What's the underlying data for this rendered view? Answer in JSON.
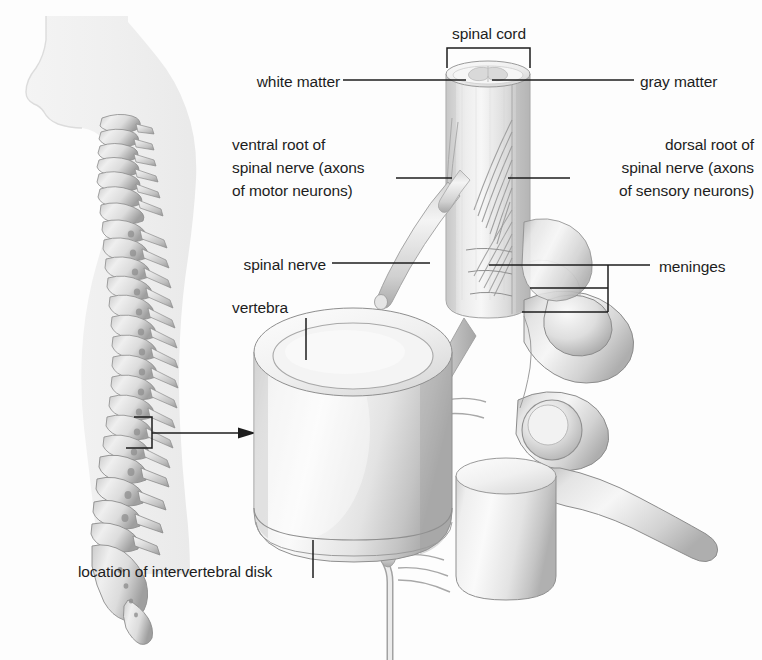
{
  "figure": {
    "background_color": "#fdfdfd",
    "ink_color": "#1d1d1d",
    "width": 762,
    "height": 660
  },
  "labels": {
    "spinal_cord": "spinal cord",
    "white_matter": "white matter",
    "gray_matter": "gray matter",
    "ventral_root_line1": "ventral root of",
    "ventral_root_line2": "spinal nerve (axons",
    "ventral_root_line3": "of motor neurons)",
    "dorsal_root_line1": "dorsal root of",
    "dorsal_root_line2": "spinal nerve (axons",
    "dorsal_root_line3": "of sensory neurons)",
    "spinal_nerve": "spinal nerve",
    "meninges": "meninges",
    "vertebra": "vertebra",
    "intervertebral_disk": "location of intervertebral disk"
  },
  "structures": {
    "silhouette": "human-torso-side-profile",
    "vertebral_column": "vertebral-column-lateral-view",
    "callout_box": "lumbar-region-detail-box",
    "callout_arrow": "magnification-arrow",
    "spinal_cord_cylinder": "spinal-cord-cross-section",
    "vertebral_body": "vertebral-body",
    "transverse_process": "transverse-process",
    "spinous_process": "spinous-process",
    "nerve_roots": "nerve-root-fibers",
    "dorsal_root_ganglion": "dorsal-root-ganglion"
  }
}
